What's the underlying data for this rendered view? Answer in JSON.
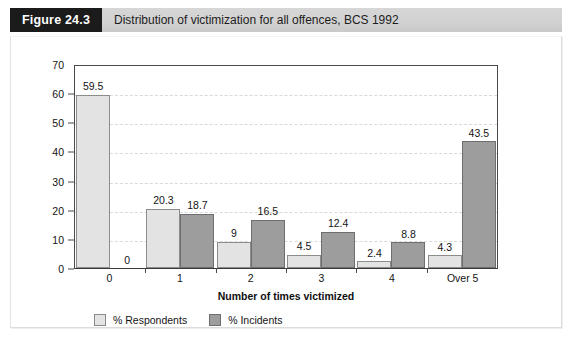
{
  "header": {
    "tag": "Figure 24.3",
    "title": "Distribution of victimization for all offences, BCS 1992"
  },
  "colors": {
    "tag_background": "#1b1b1b",
    "tag_text": "#ffffff",
    "titlebar_background": "#d2d2d2",
    "respondents_fill": "#e3e3e3",
    "incidents_fill": "#9d9d9d",
    "axis_line": "#4a4a4a",
    "gridline": "#d9d9d9"
  },
  "chart_data": {
    "type": "bar",
    "title": "Distribution of victimization for all offences, BCS 1992",
    "subtitle": "",
    "xlabel": "Number of times victimized",
    "ylabel": "",
    "categories": [
      "0",
      "1",
      "2",
      "3",
      "4",
      "Over 5"
    ],
    "series": [
      {
        "name": "% Respondents",
        "color": "#e3e3e3",
        "values": [
          59.5,
          20.3,
          9,
          4.5,
          2.4,
          4.3
        ],
        "labels": [
          "59.5",
          "20.3",
          "9",
          "4.5",
          "2.4",
          "4.3"
        ]
      },
      {
        "name": "% Incidents",
        "color": "#9d9d9d",
        "values": [
          0,
          18.7,
          16.5,
          12.4,
          8.8,
          43.5
        ],
        "labels": [
          "0",
          "18.7",
          "16.5",
          "12.4",
          "8.8",
          "43.5"
        ]
      }
    ],
    "ylim": [
      0,
      70
    ],
    "yticks": [
      0,
      10,
      20,
      30,
      40,
      50,
      60,
      70
    ],
    "ytick_labels": [
      "0",
      "10",
      "20",
      "30",
      "40",
      "50",
      "60",
      "70"
    ],
    "grid": "horizontal-dashed",
    "legend_position": "bottom-left"
  },
  "legend": [
    {
      "label": "% Respondents",
      "swatch": "respondents"
    },
    {
      "label": "% Incidents",
      "swatch": "incidents"
    }
  ]
}
